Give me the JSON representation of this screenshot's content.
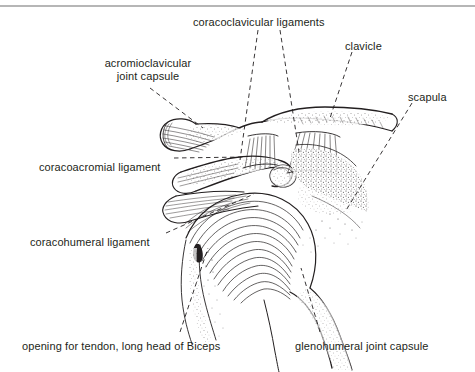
{
  "figure": {
    "type": "anatomical line drawing",
    "top_rule": true,
    "ink_color": "#231f20",
    "background_color": "#ffffff"
  },
  "labels": [
    {
      "id": "coracoclavicular-ligaments",
      "text": "coracoclavicular ligaments",
      "lines": [
        "coracoclavicular ligaments"
      ],
      "x": 193,
      "y": 16,
      "align": "left"
    },
    {
      "id": "clavicle",
      "text": "clavicle",
      "lines": [
        "clavicle"
      ],
      "x": 345,
      "y": 40,
      "align": "left"
    },
    {
      "id": "acromioclavicular-joint-capsule",
      "text": "acromioclavicular joint capsule",
      "lines": [
        "acromioclavicular",
        "joint capsule"
      ],
      "x": 88,
      "y": 57,
      "align": "center"
    },
    {
      "id": "scapula",
      "text": "scapula",
      "lines": [
        "scapula"
      ],
      "x": 408,
      "y": 91,
      "align": "left"
    },
    {
      "id": "coracoacromial-ligament",
      "text": "coracoacromial ligament",
      "lines": [
        "coracoacromial ligament"
      ],
      "x": 39,
      "y": 161,
      "align": "left"
    },
    {
      "id": "coracohumeral-ligament",
      "text": "coracohumeral ligament",
      "lines": [
        "coracohumeral ligament"
      ],
      "x": 30,
      "y": 236,
      "align": "left"
    },
    {
      "id": "opening-for-tendon-long-head-of-biceps",
      "text": "opening for tendon, long head of Biceps",
      "lines": [
        "opening for tendon, long head of Biceps"
      ],
      "x": 22,
      "y": 340,
      "align": "left"
    },
    {
      "id": "glenohumeral-joint-capsule",
      "text": "glenohumeral joint capsule",
      "lines": [
        "glenohumeral joint capsule"
      ],
      "x": 295,
      "y": 340,
      "align": "left"
    }
  ],
  "leader_lines": [
    {
      "id": "leader-coracoclavicular-left",
      "from": [
        258,
        30
      ],
      "to": [
        240,
        160
      ]
    },
    {
      "id": "leader-coracoclavicular-right",
      "from": [
        280,
        30
      ],
      "to": [
        296,
        150
      ]
    },
    {
      "id": "leader-clavicle",
      "from": [
        352,
        52
      ],
      "to": [
        330,
        118
      ]
    },
    {
      "id": "leader-acromioclavicular",
      "from": [
        150,
        88
      ],
      "to": [
        203,
        128
      ]
    },
    {
      "id": "leader-scapula",
      "from": [
        412,
        103
      ],
      "to": [
        345,
        210
      ]
    },
    {
      "id": "leader-coracoacromial",
      "from": [
        172,
        158
      ],
      "to": [
        243,
        157
      ]
    },
    {
      "id": "leader-coracohumeral",
      "from": [
        166,
        233
      ],
      "to": [
        253,
        194
      ]
    },
    {
      "id": "leader-biceps-opening",
      "from": [
        180,
        333
      ],
      "to": [
        206,
        250
      ]
    },
    {
      "id": "leader-glenohumeral",
      "from": [
        320,
        333
      ],
      "to": [
        300,
        270
      ]
    }
  ]
}
